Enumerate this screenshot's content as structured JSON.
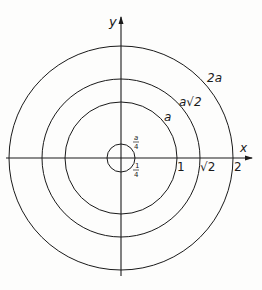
{
  "diagram": {
    "axes": {
      "x_label": "x",
      "y_label": "y"
    },
    "circles": [
      {
        "name": "quarter",
        "radius_label_top": "a",
        "radius_label_top_den": "4",
        "radius_label_bottom_num": "1",
        "radius_label_bottom_den": "4"
      },
      {
        "name": "a",
        "label": "a",
        "x_tick": "1"
      },
      {
        "name": "a-sqrt2",
        "label": "a√2",
        "x_tick": "√2"
      },
      {
        "name": "2a",
        "label": "2a",
        "x_tick": "2"
      }
    ],
    "colors": {
      "stroke": "#1a1a1a",
      "background": "#fdfdfc"
    }
  }
}
